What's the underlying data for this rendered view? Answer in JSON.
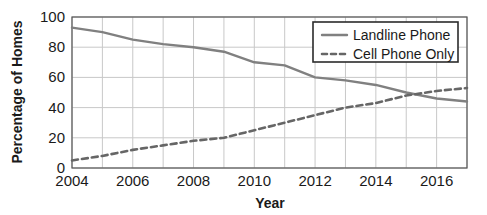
{
  "chart_data": {
    "type": "line",
    "title": "",
    "xlabel": "Year",
    "ylabel": "Percentage of Homes",
    "xlim": [
      2004,
      2017
    ],
    "ylim": [
      0,
      100
    ],
    "grid": true,
    "legend_position": "top-right",
    "x": [
      2004,
      2005,
      2006,
      2007,
      2008,
      2009,
      2010,
      2011,
      2012,
      2013,
      2014,
      2015,
      2016,
      2017
    ],
    "xticks": [
      2004,
      2006,
      2008,
      2010,
      2012,
      2014,
      2016
    ],
    "xtick_labels": [
      "2004",
      "2006",
      "2008",
      "2010",
      "2012",
      "2014",
      "2016"
    ],
    "yticks": [
      0,
      20,
      40,
      60,
      80,
      100
    ],
    "ytick_labels": [
      "0",
      "20",
      "40",
      "60",
      "80",
      "100"
    ],
    "series": [
      {
        "name": "Landline Phone",
        "style": "solid",
        "color": "#808080",
        "values": [
          93,
          90,
          85,
          82,
          80,
          77,
          70,
          68,
          60,
          58,
          55,
          50,
          46,
          44
        ]
      },
      {
        "name": "Cell Phone Only",
        "style": "dashed",
        "color": "#666666",
        "values": [
          5,
          8,
          12,
          15,
          18,
          20,
          25,
          30,
          35,
          40,
          43,
          48,
          51,
          53
        ]
      }
    ]
  },
  "axes": {
    "y_title": "Percentage of Homes",
    "x_title": "Year"
  },
  "legend": {
    "items": [
      {
        "label": "Landline Phone",
        "style": "solid"
      },
      {
        "label": "Cell Phone Only",
        "style": "dashed"
      }
    ]
  },
  "colors": {
    "landline": "#808080",
    "cell": "#666666",
    "grid": "#c8c8c8",
    "axis": "#555555",
    "text": "#1a1a1a",
    "legend_border": "#2b2b2b",
    "background": "#ffffff"
  }
}
